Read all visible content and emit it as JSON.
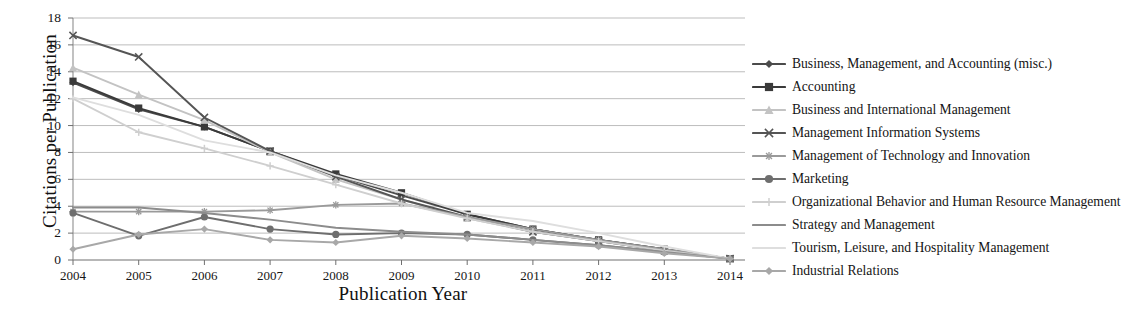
{
  "chart_data": {
    "type": "line",
    "title": "",
    "xlabel": "Publication Year",
    "ylabel": "Citations per Publication",
    "x": [
      2004,
      2005,
      2006,
      2007,
      2008,
      2009,
      2010,
      2011,
      2012,
      2013,
      2014
    ],
    "xtick_labels": [
      "2004",
      "2005",
      "2006",
      "2007",
      "2008",
      "2009",
      "2010",
      "2011",
      "2012",
      "2013",
      "2014"
    ],
    "ytick_labels": [
      "0",
      "2",
      "4",
      "6",
      "8",
      "10",
      "12",
      "14",
      "16",
      "18"
    ],
    "ylim": [
      0,
      18
    ],
    "ytick_step": 2,
    "grid": "horizontal",
    "legend_position": "right",
    "series": [
      {
        "name": "Business, Management, and Accounting (misc.)",
        "marker": "diamond",
        "color": "#4b4b4b",
        "values": [
          13.2,
          11.2,
          9.9,
          8.1,
          6.3,
          4.8,
          3.4,
          2.3,
          1.5,
          0.8,
          0.1
        ]
      },
      {
        "name": "Accounting",
        "marker": "square",
        "color": "#3a3a3a",
        "values": [
          13.3,
          11.3,
          9.9,
          8.1,
          6.4,
          5.0,
          3.4,
          2.3,
          1.5,
          0.8,
          0.1
        ]
      },
      {
        "name": "Business and International Management",
        "marker": "triangle",
        "color": "#c3c3c3",
        "values": [
          14.3,
          12.3,
          10.4,
          8.0,
          6.0,
          4.5,
          3.1,
          2.1,
          1.4,
          0.7,
          0.1
        ]
      },
      {
        "name": "Management Information Systems",
        "marker": "x",
        "color": "#555555",
        "values": [
          16.7,
          15.1,
          10.6,
          8.1,
          6.2,
          4.5,
          3.2,
          2.1,
          1.4,
          0.7,
          0.1
        ]
      },
      {
        "name": "Management of Technology and Innovation",
        "marker": "asterisk",
        "color": "#9a9a9a",
        "values": [
          3.6,
          3.6,
          3.6,
          3.7,
          4.1,
          4.2,
          3.2,
          2.3,
          1.5,
          0.8,
          0.1
        ]
      },
      {
        "name": "Marketing",
        "marker": "circle",
        "color": "#6e6e6e",
        "values": [
          3.5,
          1.8,
          3.2,
          2.3,
          1.9,
          2.0,
          1.9,
          1.5,
          1.1,
          0.6,
          0.1
        ]
      },
      {
        "name": "Organizational Behavior and Human Resource Management",
        "marker": "plus",
        "color": "#cfcfcf",
        "values": [
          12.0,
          9.5,
          8.3,
          7.0,
          5.6,
          4.2,
          3.1,
          2.1,
          1.4,
          0.7,
          0.1
        ]
      },
      {
        "name": "Strategy and Management",
        "marker": "none",
        "color": "#8c8c8c",
        "values": [
          3.9,
          3.9,
          3.5,
          3.0,
          2.4,
          2.1,
          1.9,
          1.5,
          1.1,
          0.6,
          0.1
        ]
      },
      {
        "name": "Tourism, Leisure, and Hospitality Management",
        "marker": "none",
        "color": "#dedede",
        "values": [
          12.1,
          10.8,
          8.9,
          8.0,
          6.3,
          5.0,
          3.5,
          2.9,
          2.0,
          1.0,
          0.1
        ]
      },
      {
        "name": "Industrial Relations",
        "marker": "diamond",
        "color": "#a8a8a8",
        "values": [
          0.8,
          1.9,
          2.3,
          1.5,
          1.3,
          1.8,
          1.6,
          1.3,
          1.0,
          0.5,
          0.1
        ]
      }
    ]
  },
  "axis": {
    "y_title": "Citations per Publication",
    "x_title": "Publication Year"
  }
}
